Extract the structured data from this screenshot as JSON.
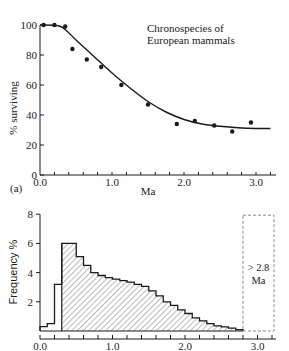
{
  "figure": {
    "panel_a_label": "(a)"
  },
  "chart_data": [
    {
      "type": "scatter",
      "title": "Chronospecies of European mammals",
      "title_lines": [
        "Chronospecies of",
        "European mammals"
      ],
      "xlabel": "Ma",
      "ylabel": "% surviving",
      "xlim": [
        0.0,
        3.2
      ],
      "ylim": [
        0,
        100
      ],
      "x_ticks": [
        "0.0",
        "1.0",
        "2.0",
        "3.0"
      ],
      "y_ticks": [
        "0",
        "20",
        "40",
        "60",
        "80",
        "100"
      ],
      "grid": false,
      "points": [
        {
          "x": 0.05,
          "y": 100
        },
        {
          "x": 0.2,
          "y": 100
        },
        {
          "x": 0.35,
          "y": 99
        },
        {
          "x": 0.45,
          "y": 84
        },
        {
          "x": 0.65,
          "y": 77
        },
        {
          "x": 0.85,
          "y": 72
        },
        {
          "x": 1.13,
          "y": 60
        },
        {
          "x": 1.5,
          "y": 47
        },
        {
          "x": 1.9,
          "y": 34
        },
        {
          "x": 2.15,
          "y": 36
        },
        {
          "x": 2.42,
          "y": 33
        },
        {
          "x": 2.67,
          "y": 29
        },
        {
          "x": 2.93,
          "y": 35
        }
      ],
      "fit_curve": [
        [
          0.0,
          100
        ],
        [
          0.25,
          99.5
        ],
        [
          0.35,
          97
        ],
        [
          0.5,
          90
        ],
        [
          0.75,
          79
        ],
        [
          1.0,
          68
        ],
        [
          1.25,
          58
        ],
        [
          1.5,
          49
        ],
        [
          1.75,
          42
        ],
        [
          2.0,
          37
        ],
        [
          2.25,
          34
        ],
        [
          2.5,
          32.5
        ],
        [
          2.75,
          31.5
        ],
        [
          3.0,
          31
        ],
        [
          3.2,
          31
        ]
      ]
    },
    {
      "type": "bar",
      "subtype": "step-histogram",
      "xlabel": "",
      "ylabel": "Frequency %",
      "xlim": [
        0.0,
        3.2
      ],
      "ylim": [
        0,
        8
      ],
      "x_ticks": [
        "0.0",
        "1.0",
        "2.0",
        "3.0"
      ],
      "y_ticks": [
        "2",
        "4",
        "6",
        "8"
      ],
      "grid": false,
      "bin_width": 0.1,
      "outline_bins": {
        "x_start": [
          0.0,
          0.1,
          0.2
        ],
        "values": [
          0.3,
          0.5,
          3.2
        ]
      },
      "hatched_bins": {
        "x_start": [
          0.3,
          0.4,
          0.5,
          0.6,
          0.7,
          0.8,
          0.9,
          1.0,
          1.1,
          1.2,
          1.3,
          1.4,
          1.5,
          1.6,
          1.7,
          1.8,
          1.9,
          2.0,
          2.1,
          2.2,
          2.3,
          2.4,
          2.5,
          2.6,
          2.7
        ],
        "values": [
          6.0,
          6.0,
          5.1,
          4.5,
          4.0,
          3.8,
          3.65,
          3.55,
          3.45,
          3.35,
          3.2,
          3.05,
          2.75,
          2.4,
          2.0,
          1.75,
          1.45,
          1.2,
          0.9,
          0.7,
          0.5,
          0.35,
          0.28,
          0.2,
          0.1
        ]
      },
      "annotation_box": {
        "x_range": [
          2.8,
          3.2
        ],
        "label_lines": [
          "> 2.8",
          "Ma"
        ],
        "style": "dashed"
      }
    }
  ]
}
